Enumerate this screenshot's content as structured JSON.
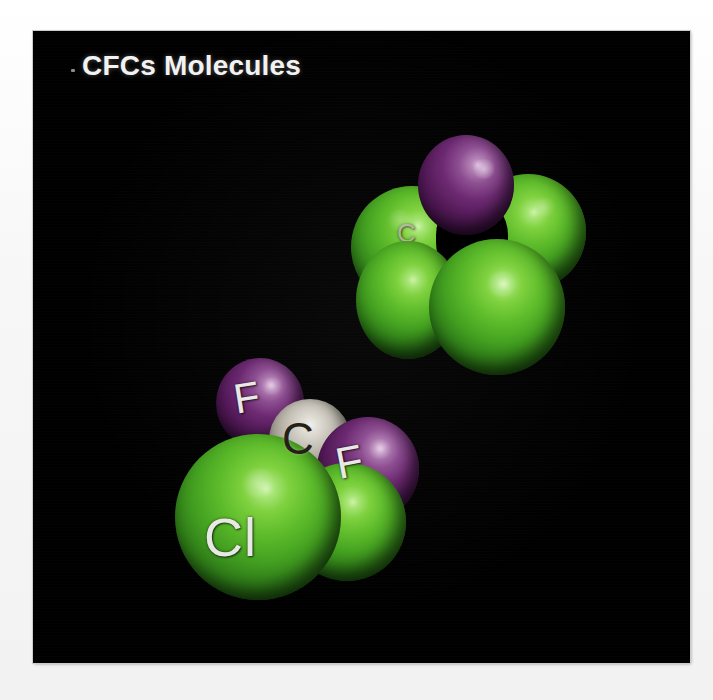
{
  "figure": {
    "title": "CFCs Molecules",
    "background_color": "#000000",
    "page_background_color": "#f4f4f4",
    "title_color": "#f2f2f2"
  },
  "legend_colors": {
    "fluorine_purple": "#6d2a72",
    "chlorine_green": "#44a121",
    "carbon_grey": "#c5c1b7"
  },
  "molecules": [
    {
      "id": "upper-molecule",
      "name": "Trichlorofluoromethane space-filling model",
      "atoms": [
        {
          "element": "F",
          "label": "",
          "color": "#6d2a72"
        },
        {
          "element": "Cl",
          "label": "",
          "color": "#44a121"
        },
        {
          "element": "Cl",
          "label": "",
          "color": "#44a121"
        },
        {
          "element": "Cl",
          "label": "",
          "color": "#44a121"
        },
        {
          "element": "C",
          "label": "C",
          "color": "#c5c1b7"
        }
      ]
    },
    {
      "id": "lower-molecule",
      "name": "Dichlorodifluoromethane space-filling model",
      "atoms": [
        {
          "element": "F",
          "label": "F",
          "color": "#6d2a72"
        },
        {
          "element": "F",
          "label": "F",
          "color": "#6d2a72"
        },
        {
          "element": "C",
          "label": "C",
          "color": "#c5c1b7"
        },
        {
          "element": "Cl",
          "label": "Cl",
          "color": "#44a121"
        },
        {
          "element": "Cl",
          "label": "",
          "color": "#44a121"
        }
      ]
    }
  ],
  "labels": {
    "upper_carbon": "C",
    "lower_f_top": "F",
    "lower_f_right": "F",
    "lower_carbon": "C",
    "lower_chlorine": "Cl"
  }
}
